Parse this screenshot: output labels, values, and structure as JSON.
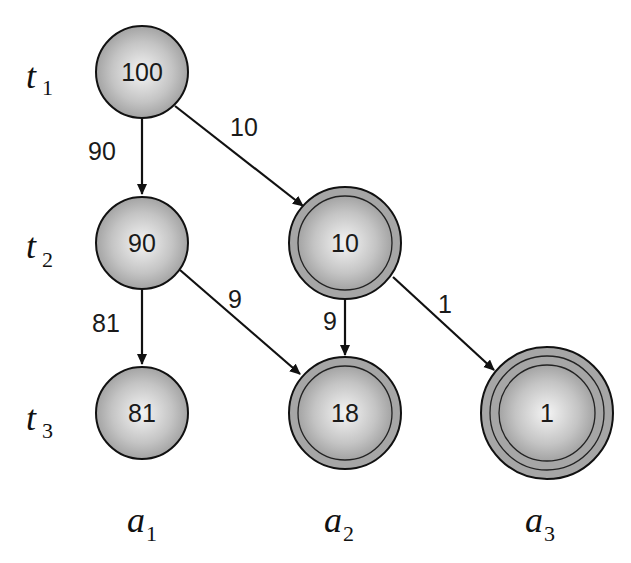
{
  "diagram": {
    "row_labels": [
      {
        "base": "t",
        "sub": "1"
      },
      {
        "base": "t",
        "sub": "2"
      },
      {
        "base": "t",
        "sub": "3"
      }
    ],
    "column_labels": [
      {
        "base": "a",
        "sub": "1"
      },
      {
        "base": "a",
        "sub": "2"
      },
      {
        "base": "a",
        "sub": "3"
      }
    ],
    "nodes": [
      {
        "id": "n100",
        "label": "100",
        "rings": 1
      },
      {
        "id": "n90",
        "label": "90",
        "rings": 1
      },
      {
        "id": "n10",
        "label": "10",
        "rings": 2
      },
      {
        "id": "n81",
        "label": "81",
        "rings": 1
      },
      {
        "id": "n18",
        "label": "18",
        "rings": 2
      },
      {
        "id": "n1",
        "label": "1",
        "rings": 3
      }
    ],
    "edges": [
      {
        "from": "100",
        "to": "90",
        "label": "90"
      },
      {
        "from": "100",
        "to": "10",
        "label": "10"
      },
      {
        "from": "90",
        "to": "81",
        "label": "81"
      },
      {
        "from": "90",
        "to": "18",
        "label": "9"
      },
      {
        "from": "10",
        "to": "18",
        "label": "9"
      },
      {
        "from": "10",
        "to": "1",
        "label": "1"
      }
    ],
    "colors": {
      "node_fill_light": "#f2f2f2",
      "node_fill_dark": "#9a9a9a",
      "ring_fill": "#a8a8a8",
      "stroke": "#111111"
    }
  }
}
